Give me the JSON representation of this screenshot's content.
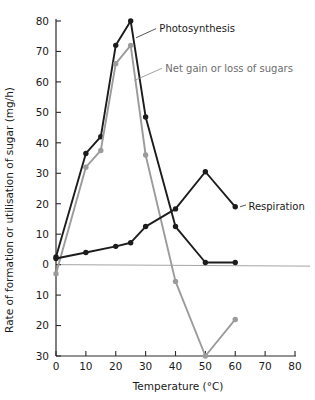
{
  "chart_data": {
    "type": "line",
    "title": "",
    "xlabel": "Temperature (°C)",
    "ylabel": "Rate of formation or utilisation of sugar (mg/h)",
    "xlim": [
      0,
      80
    ],
    "ylim": [
      -30,
      80
    ],
    "grid": false,
    "legend_position": "inline-annotations",
    "xticks": [
      0,
      10,
      20,
      30,
      40,
      50,
      60,
      70,
      80
    ],
    "xticklabels": [
      "0",
      "10",
      "20",
      "30",
      "40",
      "50",
      "60",
      "70",
      "80"
    ],
    "yticks": [
      80,
      70,
      60,
      50,
      40,
      30,
      20,
      10,
      0,
      -10,
      -20,
      -30
    ],
    "yticklabels": [
      "80",
      "70",
      "60",
      "50",
      "40",
      "30",
      "20",
      "10",
      "0",
      "10",
      "20",
      "30"
    ],
    "ytick_note": "Values below zero are labelled as positive magnitudes on the axis",
    "zero_reference_line": 0,
    "series": [
      {
        "name": "Photosynthesis",
        "color": "#1c1c1c",
        "x": [
          0,
          10,
          15,
          20,
          25,
          30,
          40,
          50,
          60
        ],
        "values": [
          2.5,
          36.5,
          42,
          72,
          80,
          48.5,
          12.5,
          0.7,
          0.7
        ]
      },
      {
        "name": "Net gain or loss of sugars",
        "color": "#9b9b9b",
        "x": [
          0,
          10,
          15,
          20,
          25,
          30,
          40,
          50,
          60
        ],
        "values": [
          -3,
          32,
          37.5,
          66,
          72,
          36,
          -5.5,
          -30,
          -18
        ]
      },
      {
        "name": "Respiration",
        "color": "#1c1c1c",
        "x": [
          0,
          10,
          20,
          25,
          30,
          40,
          50,
          60
        ],
        "values": [
          2,
          4,
          6,
          7.2,
          12.5,
          18.3,
          30.5,
          19
        ]
      }
    ],
    "annotations": [
      {
        "text": "Photosynthesis",
        "color": "#1a1a1a",
        "anchor_series": "Photosynthesis"
      },
      {
        "text": "Net gain or loss of sugars",
        "color": "#6d6d6d",
        "anchor_series": "Net gain or loss of sugars"
      },
      {
        "text": "Respiration",
        "color": "#1a1a1a",
        "anchor_series": "Respiration"
      }
    ]
  }
}
